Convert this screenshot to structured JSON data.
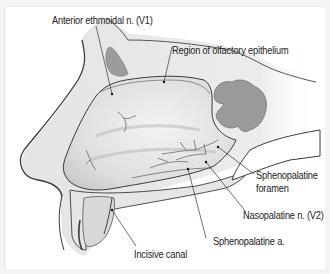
{
  "figure": {
    "labels": [
      {
        "id": "anterior-ethmoidal",
        "text": "Anterior ethmoidal n. (V1)"
      },
      {
        "id": "olfactory-region",
        "text": "Region of olfactory epithelium"
      },
      {
        "id": "sphenopalatine-foramen-1",
        "text": "Sphenopalatine"
      },
      {
        "id": "sphenopalatine-foramen-2",
        "text": "foramen"
      },
      {
        "id": "nasopalatine",
        "text": "Nasopalatine n. (V2)"
      },
      {
        "id": "sphenopalatine-artery",
        "text": "Sphenopalatine a."
      },
      {
        "id": "incisive-canal",
        "text": "Incisive canal"
      }
    ],
    "colors": {
      "background": "#f4f4f4",
      "panel": "#ffffff",
      "outline": "#3a3a3a",
      "bone": "#e9e9e9",
      "mucosa": "#dcdcdc",
      "sinus": "#9a9a9a",
      "leader_line": "#333333"
    }
  }
}
